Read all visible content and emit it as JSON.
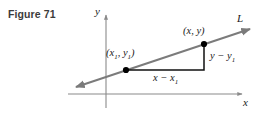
{
  "figure": {
    "caption": "Figure 71",
    "type": "coordinate-plane-slope-diagram"
  },
  "axes": {
    "y_label": "y",
    "x_label": "x",
    "y_axis_name": "vertical-axis",
    "x_axis_name": "horizontal-axis"
  },
  "line": {
    "label": "L",
    "name": "line-l",
    "color": "#7b7b7b",
    "direction": "rising-left-to-right",
    "arrow_ends": "both"
  },
  "points": [
    {
      "name": "point-x1-y1",
      "label": "(x₁, y₁)",
      "label_html": "(<i>x</i><sub>1</sub>, <i>y</i><sub>1</sub>)",
      "coords_px": {
        "x": 126,
        "y": 70
      }
    },
    {
      "name": "point-x-y",
      "label": "(x, y)",
      "label_html": "(<i>x</i>, <i>y</i>)",
      "coords_px": {
        "x": 204,
        "y": 44
      }
    }
  ],
  "legs": {
    "run": {
      "label": "x − x₁",
      "label_html": "<i>x</i> − <i>x</i><sub>1</sub>",
      "name": "run-segment",
      "color": "#111111"
    },
    "rise": {
      "label": "y − y₁",
      "label_html": "<i>y</i> − <i>y</i><sub>1</sub>",
      "name": "rise-segment",
      "color": "#111111"
    }
  },
  "colors": {
    "caption": "#3c3c3c",
    "axis": "#8a8a8a",
    "line": "#7b7b7b",
    "leg": "#111111",
    "point": "#000000",
    "background": "#ffffff"
  }
}
